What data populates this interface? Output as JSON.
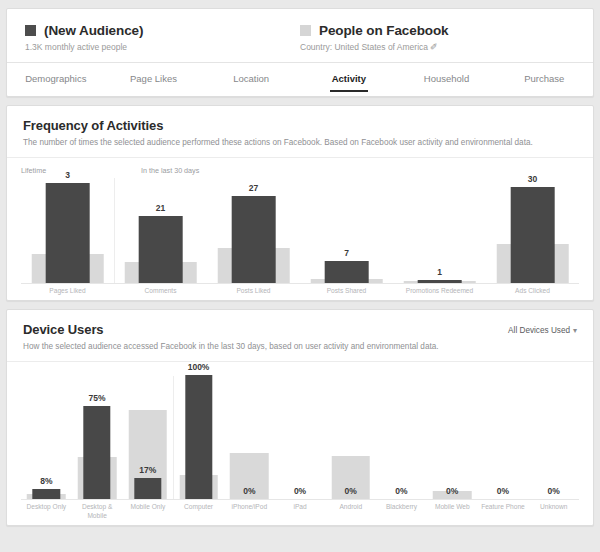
{
  "header": {
    "audience": {
      "swatch_color": "#4d4d4d",
      "name": "(New Audience)",
      "subtitle": "1.3K monthly active people"
    },
    "comparison": {
      "swatch_color": "#d5d5d5",
      "name": "People on Facebook",
      "subtitle": "Country: United States of America ✐"
    },
    "tabs": [
      {
        "label": "Demographics",
        "active": false
      },
      {
        "label": "Page Likes",
        "active": false
      },
      {
        "label": "Location",
        "active": false
      },
      {
        "label": "Activity",
        "active": true
      },
      {
        "label": "Household",
        "active": false
      },
      {
        "label": "Purchase",
        "active": false
      }
    ]
  },
  "frequency_section": {
    "title": "Frequency of Activities",
    "description": "The number of times the selected audience performed these actions on Facebook. Based on Facebook user activity and environmental data.",
    "period_labels": [
      {
        "text": "Lifetime",
        "left_pct": 0
      },
      {
        "text": "In the last 30 days",
        "left_pct": 21.5
      }
    ]
  },
  "device_section": {
    "title": "Device Users",
    "description": "How the selected audience accessed Facebook in the last 30 days, based on user activity and environmental data.",
    "action_label": "All Devices Used",
    "action_caret": "▾"
  },
  "chart_data": [
    {
      "type": "bar",
      "title": "Frequency of Activities",
      "xlabel": "",
      "ylabel": "",
      "grid": false,
      "legend_position": "top",
      "axis_max": 33,
      "categories": [
        "Pages Liked",
        "Comments",
        "Posts Liked",
        "Posts Shared",
        "Promotions Redeemed",
        "Ads Clicked"
      ],
      "series": [
        {
          "name": "(New Audience)",
          "color": "#484848",
          "values": [
            3,
            21,
            27,
            7,
            1,
            30
          ],
          "value_labels": [
            "3",
            "21",
            "27",
            "7",
            "1",
            "30"
          ]
        },
        {
          "name": "People on Facebook",
          "color": "#d9d9d9",
          "values": [
            9,
            6.5,
            11,
            1.2,
            0.6,
            12
          ],
          "value_labels": [
            "",
            "",
            "",
            "",
            "",
            ""
          ]
        }
      ],
      "group_separator_after": 0,
      "note": "Dark bars are plotted on a per-group relative scale; Pages Liked (3) is a lifetime metric shown at full height."
    },
    {
      "type": "bar",
      "title": "Device Users",
      "xlabel": "",
      "ylabel": "",
      "grid": false,
      "legend_position": "top",
      "axis_max": 100,
      "unit": "%",
      "categories": [
        "Desktop Only",
        "Desktop & Mobile",
        "Mobile Only",
        "Computer",
        "iPhone/iPod",
        "iPad",
        "Android",
        "Blackberry",
        "Mobile Web",
        "Feature Phone",
        "Unknown"
      ],
      "series": [
        {
          "name": "(New Audience)",
          "color": "#484848",
          "values": [
            8,
            75,
            17,
            100,
            0,
            0,
            0,
            0,
            0,
            0,
            0
          ],
          "value_labels": [
            "8%",
            "75%",
            "17%",
            "100%",
            "0%",
            "0%",
            "0%",
            "0%",
            "0%",
            "0%",
            "0%"
          ]
        },
        {
          "name": "People on Facebook",
          "color": "#d9d9d9",
          "values": [
            4,
            34,
            72,
            19,
            37,
            0,
            35,
            0,
            6,
            0,
            0
          ],
          "value_labels": [
            "",
            "",
            "",
            "",
            "",
            "",
            "",
            "",
            "",
            "",
            ""
          ]
        }
      ],
      "group_separator_after": 2
    }
  ]
}
